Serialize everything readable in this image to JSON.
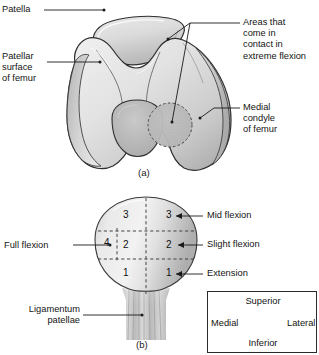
{
  "figure": {
    "background_color": "#ffffff",
    "outline_color": "#2b2b2b",
    "bone_fill_light": "#f2f2f2",
    "bone_fill_mid": "#d8d8d8",
    "bone_fill_dark": "#b4b4b4",
    "contact_area_fill": "#bdbdbd",
    "leader_color": "#1a1a1a"
  },
  "panel_a": {
    "id": "(a)",
    "labels": {
      "patella": "Patella",
      "patellar_surface_of_femur": "Patellar\nsurface\nof femur",
      "areas_contact": "Areas that\ncome in\ncontact in\nextreme flexion",
      "medial_condyle": "Medial\ncondyle\nof femur"
    }
  },
  "panel_b": {
    "id": "(b)",
    "labels": {
      "full_flexion": "Full flexion",
      "ligamentum_patellae": "Ligamentum\npatellae",
      "mid_flexion": "Mid flexion",
      "slight_flexion": "Slight flexion",
      "extension": "Extension"
    },
    "zones": [
      {
        "number": "3",
        "side": "medial",
        "meaning": "Mid flexion"
      },
      {
        "number": "3",
        "side": "lateral",
        "meaning": "Mid flexion"
      },
      {
        "number": "2",
        "side": "medial",
        "meaning": "Slight flexion"
      },
      {
        "number": "2",
        "side": "lateral",
        "meaning": "Slight flexion"
      },
      {
        "number": "1",
        "side": "medial",
        "meaning": "Extension"
      },
      {
        "number": "1",
        "side": "lateral",
        "meaning": "Extension"
      },
      {
        "number": "4",
        "side": "far-medial",
        "meaning": "Full flexion"
      }
    ]
  },
  "orientation_key": {
    "superior": "Superior",
    "inferior": "Inferior",
    "medial": "Medial",
    "lateral": "Lateral"
  }
}
